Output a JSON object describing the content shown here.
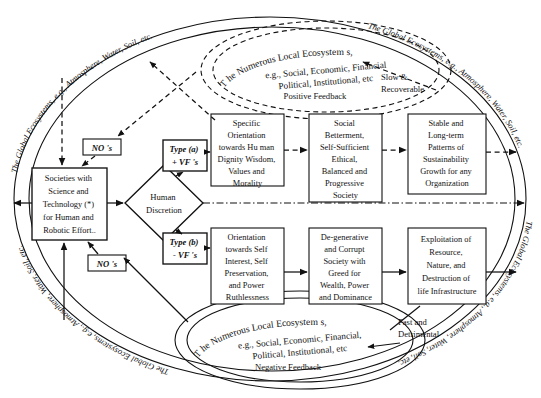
{
  "diagram": {
    "outer_ellipse_labels": {
      "top_left": "The Global Ecosystems, e.g., Atmosphere, Water, Soil, etc.",
      "top_right": "The Global Ecosystems, e.g., Atmosphere, Water, Soil, etc.",
      "bottom_left": "The Global Ecosystems, e.g., Atmosphere, Water, Soil, etc.",
      "bottom_right": "The Global Ecosystems, e.g., Atmosphere, Water, Soil, etc."
    },
    "top_ellipse": {
      "line1": "T he Numerous Local Ecosystem s,",
      "line2": "e.g., Social, Economic, Financial",
      "line3": "Political, Institutional, etc",
      "feedback": "Positive    Feedback"
    },
    "bottom_ellipse": {
      "line1": "T he Numerous Local Ecosystem s,",
      "line2": "e.g., Social, Economic, Financial,",
      "line3": "Political, Institutional, etc",
      "feedback": "Negative Feedback"
    },
    "source_box": {
      "lines": [
        "Societies with",
        "Science and",
        "Technology (*)",
        "for Human and",
        "Robotic Effort.."
      ]
    },
    "decision": {
      "lines": [
        "Human",
        "Discretion"
      ]
    },
    "type_a": {
      "line1": "Type (a)",
      "line2": "+ VF 's"
    },
    "type_b": {
      "line1": "Type (b)",
      "line2": "- VF 's"
    },
    "upper_chain": [
      {
        "lines": [
          "Specific",
          "Orientation",
          "towards   Hu man",
          "Dignity   Wisdom,",
          "Values  and",
          "Morality"
        ]
      },
      {
        "lines": [
          "Social",
          "Betterment,",
          "Self-Sufficient",
          "Ethical,",
          "Balanced and",
          "Progressive",
          "Society"
        ]
      },
      {
        "lines": [
          "Stable and",
          "Long-term",
          "Patterns of",
          "Sustainability",
          "Growth for any",
          "Organization"
        ]
      }
    ],
    "lower_chain": [
      {
        "lines": [
          "Orientation",
          "towards Self",
          "Interest, Self",
          "Preservation,",
          "and Power",
          "Ruthlessness"
        ]
      },
      {
        "lines": [
          "De-generative",
          "and Corrupt",
          "Society with",
          "Greed for",
          "Wealth, Power",
          "and Dominance"
        ]
      },
      {
        "lines": [
          "Exploitation of",
          "Resource,",
          "Nature, and",
          "Destruction of",
          "life Infrastructure"
        ]
      }
    ],
    "no_label_upper": "NO 's",
    "no_label_lower": "NO 's",
    "annotation_slow": {
      "line1": "Slow &",
      "line2": "Recoverable"
    },
    "annotation_fast": {
      "line1": "Fast and",
      "line2": "Detrimental"
    },
    "colors": {
      "stroke": "#111111",
      "background": "#ffffff"
    }
  }
}
